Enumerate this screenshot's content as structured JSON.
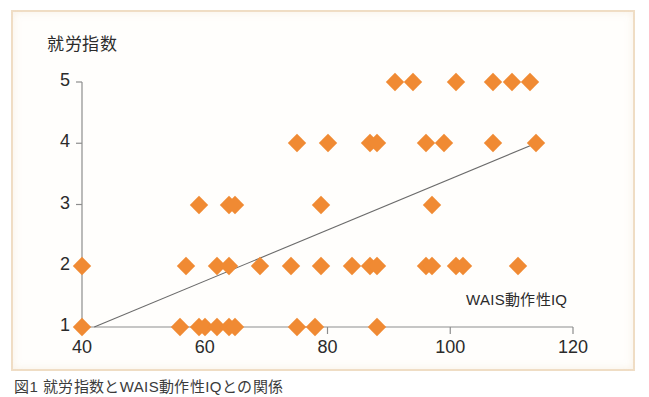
{
  "figure": {
    "frame_border_color": "#f0dcc2",
    "background_color": "#fffefc",
    "caption_text": "図1  就労指数とWAIS動作性IQとの関係"
  },
  "chart_data": {
    "type": "scatter",
    "title": "",
    "subtitle": "",
    "xlabel": "WAIS動作性IQ",
    "ylabel": "就労指数",
    "xlim": [
      40,
      120
    ],
    "ylim": [
      1,
      5
    ],
    "xticks": [
      40,
      60,
      80,
      100,
      120
    ],
    "yticks": [
      1,
      2,
      3,
      4,
      5
    ],
    "xtick_labels": [
      "40",
      "60",
      "80",
      "100",
      "120"
    ],
    "ytick_labels": [
      "1",
      "2",
      "3",
      "4",
      "5"
    ],
    "grid": false,
    "legend": null,
    "marker": "diamond",
    "marker_color": "#f08a33",
    "marker_size_px": 13,
    "trendline": {
      "color": "#6b6b6b",
      "x_start": 42,
      "y_start": 1,
      "x_end": 114,
      "y_end": 4
    },
    "points": [
      {
        "x": 40,
        "y": 1
      },
      {
        "x": 40,
        "y": 2
      },
      {
        "x": 56,
        "y": 1
      },
      {
        "x": 59,
        "y": 1
      },
      {
        "x": 60,
        "y": 1
      },
      {
        "x": 62,
        "y": 1
      },
      {
        "x": 64,
        "y": 1
      },
      {
        "x": 65,
        "y": 1
      },
      {
        "x": 75,
        "y": 1
      },
      {
        "x": 78,
        "y": 1
      },
      {
        "x": 88,
        "y": 1
      },
      {
        "x": 57,
        "y": 2
      },
      {
        "x": 62,
        "y": 2
      },
      {
        "x": 64,
        "y": 2
      },
      {
        "x": 69,
        "y": 2
      },
      {
        "x": 74,
        "y": 2
      },
      {
        "x": 79,
        "y": 2
      },
      {
        "x": 84,
        "y": 2
      },
      {
        "x": 87,
        "y": 2
      },
      {
        "x": 88,
        "y": 2
      },
      {
        "x": 96,
        "y": 2
      },
      {
        "x": 97,
        "y": 2
      },
      {
        "x": 101,
        "y": 2
      },
      {
        "x": 102,
        "y": 2
      },
      {
        "x": 111,
        "y": 2
      },
      {
        "x": 59,
        "y": 3
      },
      {
        "x": 64,
        "y": 3
      },
      {
        "x": 65,
        "y": 3
      },
      {
        "x": 79,
        "y": 3
      },
      {
        "x": 97,
        "y": 3
      },
      {
        "x": 75,
        "y": 4
      },
      {
        "x": 80,
        "y": 4
      },
      {
        "x": 87,
        "y": 4
      },
      {
        "x": 88,
        "y": 4
      },
      {
        "x": 96,
        "y": 4
      },
      {
        "x": 99,
        "y": 4
      },
      {
        "x": 107,
        "y": 4
      },
      {
        "x": 114,
        "y": 4
      },
      {
        "x": 91,
        "y": 5
      },
      {
        "x": 94,
        "y": 5
      },
      {
        "x": 101,
        "y": 5
      },
      {
        "x": 107,
        "y": 5
      },
      {
        "x": 110,
        "y": 5
      },
      {
        "x": 113,
        "y": 5
      }
    ]
  }
}
